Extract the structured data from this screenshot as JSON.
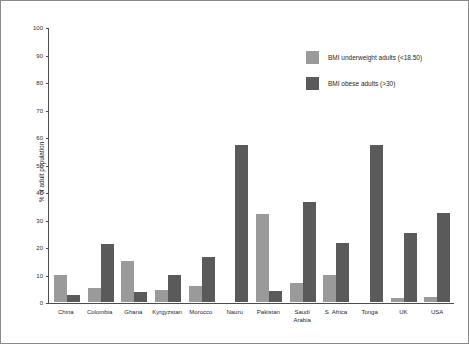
{
  "chart_data": {
    "type": "bar",
    "title": "",
    "xlabel": "",
    "ylabel": "% of adult population",
    "ylim": [
      0,
      100
    ],
    "yticks": [
      0,
      10,
      20,
      30,
      40,
      50,
      60,
      70,
      80,
      90,
      100
    ],
    "grid": false,
    "legend_position": "top-right",
    "categories": [
      "China",
      "Colombia",
      "Ghana",
      "Kyrgyzstan",
      "Morocco",
      "Nauru",
      "Pakistan",
      "Saudi\nArabia",
      "S. Africa",
      "Tonga",
      "UK",
      "USA"
    ],
    "series": [
      {
        "name": "BMI underweight adults (<18.50)",
        "color": "#9a9a9a",
        "values": [
          9.8,
          5.0,
          15.0,
          4.2,
          6.0,
          null,
          32.0,
          7.0,
          10.0,
          null,
          1.5,
          2.0
        ]
      },
      {
        "name": "BMI obese adults (>30)",
        "color": "#5a5a5a",
        "values": [
          2.5,
          21.0,
          3.5,
          10.0,
          16.5,
          57.0,
          4.0,
          36.5,
          21.5,
          57.0,
          25.0,
          32.5
        ]
      }
    ]
  },
  "axis": {
    "y_label": "% of adult population",
    "y_ticks": [
      "0",
      "10",
      "20",
      "30",
      "40",
      "50",
      "60",
      "70",
      "80",
      "90",
      "100"
    ]
  },
  "legend": {
    "items": [
      {
        "label": "BMI underweight adults (<18.50)"
      },
      {
        "label": "BMI obese adults (>30)"
      }
    ]
  }
}
